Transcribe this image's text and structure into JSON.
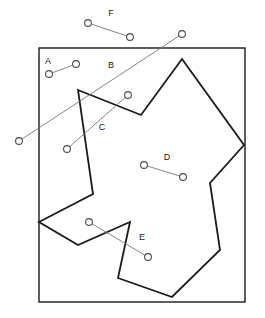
{
  "figure": {
    "width": 265,
    "height": 318,
    "background_color": "#ffffff",
    "stroke_color": "#1a1a1a",
    "segment_color": "#767676",
    "frame": {
      "name": "bounding-rectangle",
      "x": 39,
      "y": 48,
      "width": 206,
      "height": 254,
      "points": "39,48 245,48 245,302 39,302"
    },
    "polygon": {
      "name": "star-region",
      "points": "78,90 141,115 182,59 244,145 210,183 220,250 172,297 118,278 130,222 78,245 39,222 93,194"
    },
    "segments": [
      {
        "id": "A",
        "label": "A",
        "label_x": 48,
        "label_y": 62,
        "x1": 49,
        "y1": 74,
        "x2": 76,
        "y2": 64
      },
      {
        "id": "B",
        "label": "B",
        "label_x": 111,
        "label_y": 66,
        "x1": 19,
        "y1": 141,
        "x2": 182,
        "y2": 34
      },
      {
        "id": "C",
        "label": "C",
        "label_x": 102,
        "label_y": 128,
        "x1": 67,
        "y1": 149,
        "x2": 128,
        "y2": 95
      },
      {
        "id": "D",
        "label": "D",
        "label_x": 167,
        "label_y": 158,
        "x1": 144,
        "y1": 165,
        "x2": 183,
        "y2": 177
      },
      {
        "id": "E",
        "label": "E",
        "label_x": 142,
        "label_y": 238,
        "x1": 89,
        "y1": 222,
        "x2": 148,
        "y2": 257
      },
      {
        "id": "F",
        "label": "F",
        "label_x": 111,
        "label_y": 14,
        "x1": 88,
        "y1": 23,
        "x2": 130,
        "y2": 37
      }
    ],
    "endpoint_radius": 3.4
  }
}
